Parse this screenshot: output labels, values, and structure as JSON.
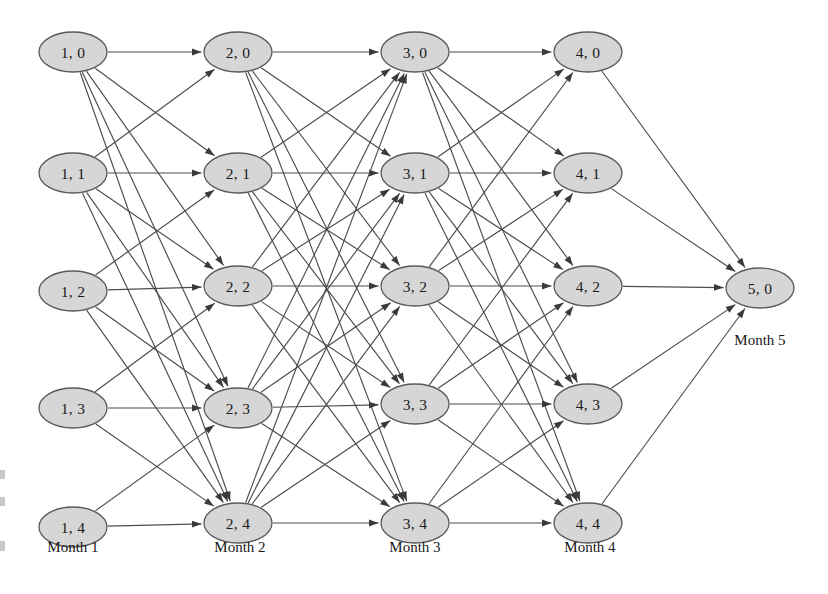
{
  "figure": {
    "type": "layered-network-trellis",
    "background_color": "#ffffff",
    "node_fill": "#d6d6d6",
    "node_stroke": "#5a5a5a",
    "edge_color": "#4c4c4c",
    "text_color": "#1a1a1a",
    "width": 828,
    "height": 594
  },
  "columns": [
    {
      "id": "month-1",
      "label": "Month 1",
      "label_x": 73,
      "label_y": 552,
      "x": 73,
      "nodes": [
        {
          "id": "1-0",
          "label": "1, 0",
          "x": 73,
          "y": 52
        },
        {
          "id": "1-1",
          "label": "1, 1",
          "x": 73,
          "y": 173
        },
        {
          "id": "1-2",
          "label": "1, 2",
          "x": 73,
          "y": 291
        },
        {
          "id": "1-3",
          "label": "1, 3",
          "x": 73,
          "y": 408
        },
        {
          "id": "1-4",
          "label": "1, 4",
          "x": 73,
          "y": 527
        }
      ]
    },
    {
      "id": "month-2",
      "label": "Month 2",
      "label_x": 240,
      "label_y": 552,
      "x": 238,
      "nodes": [
        {
          "id": "2-0",
          "label": "2, 0",
          "x": 238,
          "y": 52
        },
        {
          "id": "2-1",
          "label": "2, 1",
          "x": 238,
          "y": 173
        },
        {
          "id": "2-2",
          "label": "2, 2",
          "x": 238,
          "y": 286
        },
        {
          "id": "2-3",
          "label": "2, 3",
          "x": 238,
          "y": 408
        },
        {
          "id": "2-4",
          "label": "2, 4",
          "x": 238,
          "y": 523
        }
      ]
    },
    {
      "id": "month-3",
      "label": "Month 3",
      "label_x": 415,
      "label_y": 552,
      "x": 415,
      "nodes": [
        {
          "id": "3-0",
          "label": "3, 0",
          "x": 415,
          "y": 52
        },
        {
          "id": "3-1",
          "label": "3, 1",
          "x": 415,
          "y": 173
        },
        {
          "id": "3-2",
          "label": "3, 2",
          "x": 415,
          "y": 286
        },
        {
          "id": "3-3",
          "label": "3, 3",
          "x": 415,
          "y": 404
        },
        {
          "id": "3-4",
          "label": "3, 4",
          "x": 415,
          "y": 523
        }
      ]
    },
    {
      "id": "month-4",
      "label": "Month 4",
      "label_x": 590,
      "label_y": 552,
      "x": 588,
      "nodes": [
        {
          "id": "4-0",
          "label": "4, 0",
          "x": 588,
          "y": 52
        },
        {
          "id": "4-1",
          "label": "4, 1",
          "x": 588,
          "y": 173
        },
        {
          "id": "4-2",
          "label": "4, 2",
          "x": 588,
          "y": 286
        },
        {
          "id": "4-3",
          "label": "4, 3",
          "x": 588,
          "y": 404
        },
        {
          "id": "4-4",
          "label": "4, 4",
          "x": 588,
          "y": 523
        }
      ]
    },
    {
      "id": "month-5",
      "label": "Month 5",
      "label_x": 760,
      "label_y": 345,
      "x": 760,
      "nodes": [
        {
          "id": "5-0",
          "label": "5, 0",
          "x": 760,
          "y": 288
        }
      ]
    }
  ],
  "node_geometry": {
    "rx": 34,
    "ry": 20
  },
  "edges": [
    {
      "from": "1-0",
      "to": "2-0"
    },
    {
      "from": "1-0",
      "to": "2-1"
    },
    {
      "from": "1-0",
      "to": "2-2"
    },
    {
      "from": "1-0",
      "to": "2-3"
    },
    {
      "from": "1-0",
      "to": "2-4"
    },
    {
      "from": "1-1",
      "to": "2-1"
    },
    {
      "from": "1-1",
      "to": "2-2"
    },
    {
      "from": "1-1",
      "to": "2-3"
    },
    {
      "from": "1-1",
      "to": "2-4"
    },
    {
      "from": "1-1",
      "to": "2-0"
    },
    {
      "from": "1-2",
      "to": "2-2"
    },
    {
      "from": "1-2",
      "to": "2-3"
    },
    {
      "from": "1-2",
      "to": "2-4"
    },
    {
      "from": "1-2",
      "to": "2-1"
    },
    {
      "from": "1-3",
      "to": "2-3"
    },
    {
      "from": "1-3",
      "to": "2-4"
    },
    {
      "from": "1-3",
      "to": "2-2"
    },
    {
      "from": "1-4",
      "to": "2-4"
    },
    {
      "from": "1-4",
      "to": "2-3"
    },
    {
      "from": "2-0",
      "to": "3-0"
    },
    {
      "from": "2-0",
      "to": "3-1"
    },
    {
      "from": "2-0",
      "to": "3-2"
    },
    {
      "from": "2-0",
      "to": "3-3"
    },
    {
      "from": "2-0",
      "to": "3-4"
    },
    {
      "from": "2-1",
      "to": "3-1"
    },
    {
      "from": "2-1",
      "to": "3-2"
    },
    {
      "from": "2-1",
      "to": "3-3"
    },
    {
      "from": "2-1",
      "to": "3-4"
    },
    {
      "from": "2-1",
      "to": "3-0"
    },
    {
      "from": "2-2",
      "to": "3-2"
    },
    {
      "from": "2-2",
      "to": "3-3"
    },
    {
      "from": "2-2",
      "to": "3-4"
    },
    {
      "from": "2-2",
      "to": "3-1"
    },
    {
      "from": "2-2",
      "to": "3-0"
    },
    {
      "from": "2-3",
      "to": "3-3"
    },
    {
      "from": "2-3",
      "to": "3-4"
    },
    {
      "from": "2-3",
      "to": "3-2"
    },
    {
      "from": "2-3",
      "to": "3-1"
    },
    {
      "from": "2-3",
      "to": "3-0"
    },
    {
      "from": "2-4",
      "to": "3-4"
    },
    {
      "from": "2-4",
      "to": "3-3"
    },
    {
      "from": "2-4",
      "to": "3-2"
    },
    {
      "from": "2-4",
      "to": "3-1"
    },
    {
      "from": "2-4",
      "to": "3-0"
    },
    {
      "from": "3-0",
      "to": "4-0"
    },
    {
      "from": "3-0",
      "to": "4-1"
    },
    {
      "from": "3-0",
      "to": "4-2"
    },
    {
      "from": "3-0",
      "to": "4-3"
    },
    {
      "from": "3-0",
      "to": "4-4"
    },
    {
      "from": "3-1",
      "to": "4-1"
    },
    {
      "from": "3-1",
      "to": "4-2"
    },
    {
      "from": "3-1",
      "to": "4-3"
    },
    {
      "from": "3-1",
      "to": "4-4"
    },
    {
      "from": "3-1",
      "to": "4-0"
    },
    {
      "from": "3-2",
      "to": "4-2"
    },
    {
      "from": "3-2",
      "to": "4-3"
    },
    {
      "from": "3-2",
      "to": "4-4"
    },
    {
      "from": "3-2",
      "to": "4-1"
    },
    {
      "from": "3-2",
      "to": "4-0"
    },
    {
      "from": "3-3",
      "to": "4-3"
    },
    {
      "from": "3-3",
      "to": "4-4"
    },
    {
      "from": "3-3",
      "to": "4-2"
    },
    {
      "from": "3-3",
      "to": "4-1"
    },
    {
      "from": "3-4",
      "to": "4-4"
    },
    {
      "from": "3-4",
      "to": "4-3"
    },
    {
      "from": "3-4",
      "to": "4-2"
    },
    {
      "from": "4-0",
      "to": "5-0"
    },
    {
      "from": "4-1",
      "to": "5-0"
    },
    {
      "from": "4-2",
      "to": "5-0"
    },
    {
      "from": "4-3",
      "to": "5-0"
    },
    {
      "from": "4-4",
      "to": "5-0"
    }
  ],
  "scan_artifacts": [
    {
      "x": 0,
      "y": 470,
      "w": 5,
      "h": 9
    },
    {
      "x": 0,
      "y": 497,
      "w": 5,
      "h": 9
    },
    {
      "x": 0,
      "y": 541,
      "w": 5,
      "h": 10
    }
  ]
}
